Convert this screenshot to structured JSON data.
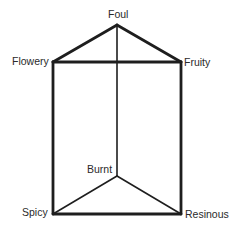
{
  "diagram": {
    "type": "odor-prism",
    "vertices": {
      "foul": {
        "label": "Foul",
        "x": 117,
        "y": 25
      },
      "flowery": {
        "label": "Flowery",
        "x": 53,
        "y": 62
      },
      "fruity": {
        "label": "Fruity",
        "x": 181,
        "y": 62
      },
      "burnt": {
        "label": "Burnt",
        "x": 117,
        "y": 176
      },
      "spicy": {
        "label": "Spicy",
        "x": 53,
        "y": 214
      },
      "resinous": {
        "label": "Resinous",
        "x": 181,
        "y": 214
      }
    },
    "edges": [
      {
        "from": "foul",
        "to": "flowery",
        "weight": "thick"
      },
      {
        "from": "foul",
        "to": "fruity",
        "weight": "thick"
      },
      {
        "from": "flowery",
        "to": "fruity",
        "weight": "thick"
      },
      {
        "from": "flowery",
        "to": "spicy",
        "weight": "thick"
      },
      {
        "from": "fruity",
        "to": "resinous",
        "weight": "thick"
      },
      {
        "from": "spicy",
        "to": "resinous",
        "weight": "thick"
      },
      {
        "from": "foul",
        "to": "burnt",
        "weight": "thin"
      },
      {
        "from": "burnt",
        "to": "spicy",
        "weight": "thin"
      },
      {
        "from": "burnt",
        "to": "resinous",
        "weight": "thin"
      }
    ],
    "line_color": "#1e1e1e",
    "text_color": "#2a2a2a"
  }
}
